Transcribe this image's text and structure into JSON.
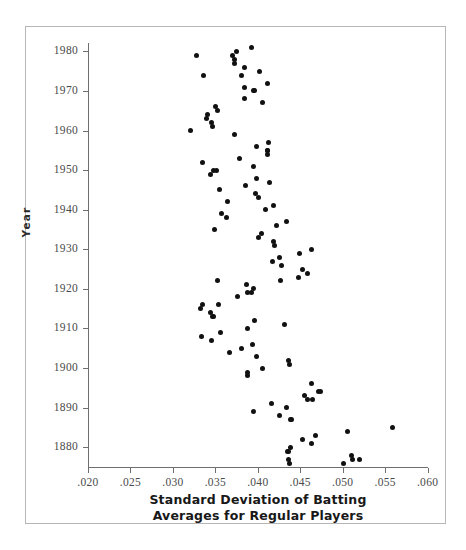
{
  "chart_data": {
    "type": "scatter",
    "title": "",
    "xlabel": "Standard Deviation of Batting\nAverages for Regular Players",
    "xlabel_line1": "Standard Deviation of Batting",
    "xlabel_line2": "Averages for Regular Players",
    "ylabel": "Year",
    "xlim": [
      0.02,
      0.06
    ],
    "ylim": [
      1875,
      1982
    ],
    "xticks": [
      0.02,
      0.025,
      0.03,
      0.035,
      0.04,
      0.045,
      0.05,
      0.055,
      0.06
    ],
    "xticklabels": [
      ".020",
      ".025",
      ".030",
      ".035",
      ".040",
      ".045",
      ".050",
      ".055",
      ".060"
    ],
    "yticks": [
      1880,
      1890,
      1900,
      1910,
      1920,
      1930,
      1940,
      1950,
      1960,
      1970,
      1980
    ],
    "yticklabels": [
      "1880",
      "1890",
      "1900",
      "1910",
      "1920",
      "1930",
      "1940",
      "1950",
      "1960",
      "1970",
      "1980"
    ],
    "grid": false,
    "legend": null,
    "marker_color": "#111111",
    "axis_color": "#6f6f6f",
    "points": [
      {
        "x": 0.0437,
        "y": 1876
      },
      {
        "x": 0.0501,
        "y": 1876
      },
      {
        "x": 0.0436,
        "y": 1877
      },
      {
        "x": 0.0512,
        "y": 1877
      },
      {
        "x": 0.052,
        "y": 1877
      },
      {
        "x": 0.051,
        "y": 1878
      },
      {
        "x": 0.0435,
        "y": 1879
      },
      {
        "x": 0.0436,
        "y": 1879
      },
      {
        "x": 0.0438,
        "y": 1880
      },
      {
        "x": 0.0463,
        "y": 1881
      },
      {
        "x": 0.0453,
        "y": 1882
      },
      {
        "x": 0.0468,
        "y": 1883
      },
      {
        "x": 0.0506,
        "y": 1884
      },
      {
        "x": 0.0559,
        "y": 1885
      },
      {
        "x": 0.0439,
        "y": 1887
      },
      {
        "x": 0.044,
        "y": 1887
      },
      {
        "x": 0.0425,
        "y": 1888
      },
      {
        "x": 0.0395,
        "y": 1889
      },
      {
        "x": 0.0434,
        "y": 1890
      },
      {
        "x": 0.0416,
        "y": 1891
      },
      {
        "x": 0.0458,
        "y": 1892
      },
      {
        "x": 0.0464,
        "y": 1892
      },
      {
        "x": 0.0455,
        "y": 1893
      },
      {
        "x": 0.0472,
        "y": 1894
      },
      {
        "x": 0.0474,
        "y": 1894
      },
      {
        "x": 0.0463,
        "y": 1896
      },
      {
        "x": 0.0388,
        "y": 1898
      },
      {
        "x": 0.0388,
        "y": 1899
      },
      {
        "x": 0.0405,
        "y": 1900
      },
      {
        "x": 0.0437,
        "y": 1901
      },
      {
        "x": 0.0436,
        "y": 1902
      },
      {
        "x": 0.0399,
        "y": 1903
      },
      {
        "x": 0.0367,
        "y": 1904
      },
      {
        "x": 0.0381,
        "y": 1905
      },
      {
        "x": 0.0394,
        "y": 1906
      },
      {
        "x": 0.0345,
        "y": 1907
      },
      {
        "x": 0.0334,
        "y": 1908
      },
      {
        "x": 0.0356,
        "y": 1909
      },
      {
        "x": 0.0388,
        "y": 1910
      },
      {
        "x": 0.0432,
        "y": 1911
      },
      {
        "x": 0.0396,
        "y": 1912
      },
      {
        "x": 0.0347,
        "y": 1913
      },
      {
        "x": 0.0348,
        "y": 1913
      },
      {
        "x": 0.0344,
        "y": 1914
      },
      {
        "x": 0.0333,
        "y": 1915
      },
      {
        "x": 0.0335,
        "y": 1916
      },
      {
        "x": 0.0354,
        "y": 1916
      },
      {
        "x": 0.0376,
        "y": 1918
      },
      {
        "x": 0.0388,
        "y": 1919
      },
      {
        "x": 0.0392,
        "y": 1919
      },
      {
        "x": 0.0395,
        "y": 1920
      },
      {
        "x": 0.0387,
        "y": 1921
      },
      {
        "x": 0.0352,
        "y": 1922
      },
      {
        "x": 0.0427,
        "y": 1922
      },
      {
        "x": 0.0448,
        "y": 1923
      },
      {
        "x": 0.0459,
        "y": 1924
      },
      {
        "x": 0.0453,
        "y": 1925
      },
      {
        "x": 0.0428,
        "y": 1926
      },
      {
        "x": 0.0417,
        "y": 1927
      },
      {
        "x": 0.0426,
        "y": 1928
      },
      {
        "x": 0.0449,
        "y": 1929
      },
      {
        "x": 0.0463,
        "y": 1930
      },
      {
        "x": 0.042,
        "y": 1931
      },
      {
        "x": 0.0419,
        "y": 1932
      },
      {
        "x": 0.0401,
        "y": 1933
      },
      {
        "x": 0.0404,
        "y": 1934
      },
      {
        "x": 0.0349,
        "y": 1935
      },
      {
        "x": 0.0422,
        "y": 1936
      },
      {
        "x": 0.0434,
        "y": 1937
      },
      {
        "x": 0.0363,
        "y": 1938
      },
      {
        "x": 0.0357,
        "y": 1939
      },
      {
        "x": 0.0409,
        "y": 1940
      },
      {
        "x": 0.0418,
        "y": 1941
      },
      {
        "x": 0.0364,
        "y": 1942
      },
      {
        "x": 0.0401,
        "y": 1943
      },
      {
        "x": 0.0397,
        "y": 1944
      },
      {
        "x": 0.0355,
        "y": 1945
      },
      {
        "x": 0.0386,
        "y": 1946
      },
      {
        "x": 0.0414,
        "y": 1947
      },
      {
        "x": 0.0399,
        "y": 1948
      },
      {
        "x": 0.0344,
        "y": 1949
      },
      {
        "x": 0.0348,
        "y": 1950
      },
      {
        "x": 0.0351,
        "y": 1950
      },
      {
        "x": 0.0395,
        "y": 1951
      },
      {
        "x": 0.0335,
        "y": 1952
      },
      {
        "x": 0.0378,
        "y": 1953
      },
      {
        "x": 0.0412,
        "y": 1954
      },
      {
        "x": 0.0411,
        "y": 1955
      },
      {
        "x": 0.0411,
        "y": 1955
      },
      {
        "x": 0.0398,
        "y": 1956
      },
      {
        "x": 0.0413,
        "y": 1957
      },
      {
        "x": 0.0372,
        "y": 1959
      },
      {
        "x": 0.0321,
        "y": 1960
      },
      {
        "x": 0.0347,
        "y": 1961
      },
      {
        "x": 0.0345,
        "y": 1962
      },
      {
        "x": 0.034,
        "y": 1963
      },
      {
        "x": 0.0341,
        "y": 1964
      },
      {
        "x": 0.0352,
        "y": 1965
      },
      {
        "x": 0.035,
        "y": 1966
      },
      {
        "x": 0.0405,
        "y": 1967
      },
      {
        "x": 0.0384,
        "y": 1968
      },
      {
        "x": 0.0395,
        "y": 1970
      },
      {
        "x": 0.0396,
        "y": 1970
      },
      {
        "x": 0.0384,
        "y": 1971
      },
      {
        "x": 0.0412,
        "y": 1972
      },
      {
        "x": 0.0381,
        "y": 1974
      },
      {
        "x": 0.0336,
        "y": 1974
      },
      {
        "x": 0.0402,
        "y": 1975
      },
      {
        "x": 0.0384,
        "y": 1976
      },
      {
        "x": 0.0373,
        "y": 1977
      },
      {
        "x": 0.0372,
        "y": 1978
      },
      {
        "x": 0.037,
        "y": 1979
      },
      {
        "x": 0.0328,
        "y": 1979
      },
      {
        "x": 0.0375,
        "y": 1980
      },
      {
        "x": 0.0392,
        "y": 1981
      }
    ]
  }
}
